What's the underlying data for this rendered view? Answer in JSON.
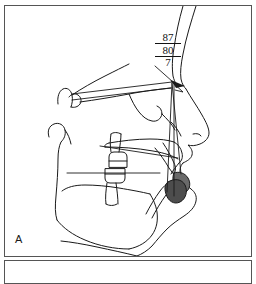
{
  "figure": {
    "type": "cephalometric-lateral-tracing",
    "panels": [
      {
        "id": "A",
        "label": "A"
      },
      {
        "id": "B",
        "label": ""
      }
    ]
  },
  "panel_a": {
    "label": "A",
    "measurements": {
      "top_value": "87",
      "middle_value": "80",
      "bottom_value": "7"
    }
  },
  "colors": {
    "outline": "#1a1a1a",
    "panel_border": "#555555",
    "background": "#ffffff",
    "tooth_shading": "#6a6a6a",
    "tooth_shading_dark": "#4d4d4d"
  }
}
